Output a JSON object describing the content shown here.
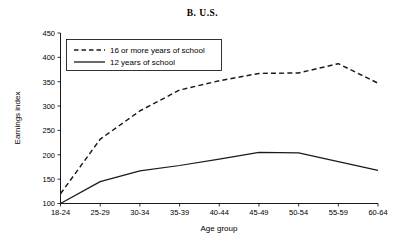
{
  "chart_data": {
    "type": "line",
    "title": "B.  U.S.",
    "xlabel": "Age group",
    "ylabel": "Earnings index",
    "categories": [
      "18-24",
      "25-29",
      "30-34",
      "35-39",
      "40-44",
      "45-49",
      "50-54",
      "55-59",
      "60-64"
    ],
    "ylim": [
      100,
      450
    ],
    "yticks": [
      100,
      150,
      200,
      250,
      300,
      350,
      400,
      450
    ],
    "grid": false,
    "legend_position": "top-left",
    "series": [
      {
        "name": "16 or more years of school",
        "style": "dashed",
        "color": "#1a1a1a",
        "values": [
          120,
          232,
          290,
          333,
          352,
          367,
          368,
          387,
          347
        ]
      },
      {
        "name": "12 years of school",
        "style": "solid",
        "color": "#1a1a1a",
        "values": [
          100,
          145,
          167,
          178,
          191,
          205,
          204,
          186,
          168
        ]
      }
    ]
  },
  "legend": {
    "entries": [
      {
        "label": "16 or more years of school"
      },
      {
        "label": "12 years of school"
      }
    ]
  }
}
